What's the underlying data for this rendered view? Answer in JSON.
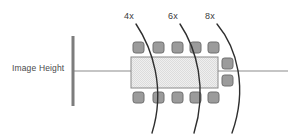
{
  "diagram": {
    "title": "Image Height",
    "axis_label": "Image Height",
    "colors": {
      "axis_line": "#8c8c8c",
      "image_plane_bar": "#7d7d7d",
      "arc_stroke": "#2f2f2f",
      "element_fill": "#9b9b9b",
      "element_stroke": "#6e6e6e",
      "body_fill": "#e8e8e8",
      "body_stroke": "#8a8a8a",
      "label_text": "#3b3b3b",
      "background": "#ffffff"
    },
    "arc_labels": [
      {
        "id": "arc-4x",
        "text": "4x"
      },
      {
        "id": "arc-6x",
        "text": "6x"
      },
      {
        "id": "arc-8x",
        "text": "8x"
      }
    ],
    "image_plane": {
      "name": "image-plane-bar",
      "x": 73,
      "y_top": 36,
      "y_bottom": 106
    },
    "optical_axis": {
      "name": "optical-axis-line",
      "y": 71,
      "x_start": 73,
      "x_end": 288
    },
    "body": {
      "name": "lens-body-rect",
      "x": 131,
      "y": 57,
      "width": 87,
      "height": 31
    },
    "elements_top_count": 5,
    "elements_bottom_count": 5,
    "elements_right_count": 2
  }
}
